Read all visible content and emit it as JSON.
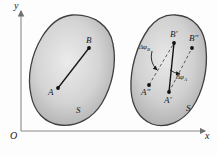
{
  "figure": {
    "type": "mechanics-rigid-body-rotation-diagram",
    "background_color": "#fdfdfd",
    "body_fill_light": "#e3e3e3",
    "body_fill_dark": "#adadad",
    "body_stroke": "#3c3c3c",
    "line_color": "#1a1a1a"
  },
  "axes": {
    "origin_label": "O",
    "x_label": "x",
    "y_label": "y",
    "axis_color": "#8a8a8a"
  },
  "bodies": [
    {
      "name": "initial-position",
      "region_label": "S",
      "points": [
        {
          "id": "A",
          "label": "A",
          "x": 58,
          "y": 88
        },
        {
          "id": "B",
          "label": "B",
          "x": 89,
          "y": 48
        }
      ],
      "segments": [
        {
          "from": "A",
          "to": "B",
          "style": "solid"
        }
      ]
    },
    {
      "name": "displaced-position",
      "region_label": "S",
      "points": [
        {
          "id": "A1",
          "label": "A'",
          "x": 169,
          "y": 92
        },
        {
          "id": "A2",
          "label": "A\"",
          "x": 149,
          "y": 85
        },
        {
          "id": "B1",
          "label": "B'",
          "x": 174,
          "y": 43
        },
        {
          "id": "B2",
          "label": "B\"",
          "x": 192,
          "y": 48
        }
      ],
      "segments": [
        {
          "from": "A1",
          "to": "B1",
          "style": "solid"
        },
        {
          "from": "A1",
          "to": "B2",
          "style": "dashed"
        },
        {
          "from": "A2",
          "to": "B1",
          "style": "dashed"
        }
      ],
      "angles": [
        {
          "id": "dphiA",
          "label": "Δφ",
          "subscript": "A",
          "at_point": "A1"
        },
        {
          "id": "dphiB",
          "label": "Δφ",
          "subscript": "B",
          "at_point": "B1"
        }
      ]
    }
  ]
}
